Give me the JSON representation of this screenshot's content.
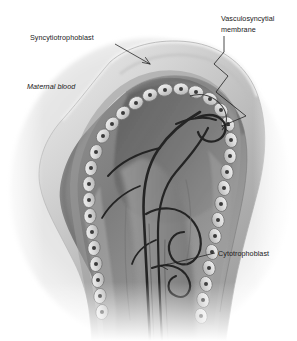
{
  "figure": {
    "type": "anatomical-illustration",
    "background_color": "#ffffff",
    "palette": {
      "outer_tissue_light": "#e8e8e8",
      "outer_tissue_mid": "#c9c9c9",
      "syncytium_band": "#b4b4b4",
      "stroma_mid": "#9a9a9a",
      "stroma_dark": "#6f6f6f",
      "stroma_darkest": "#4e4e4e",
      "cell_body": "#dcdcdc",
      "cell_outline": "#6b6b6b",
      "cell_nucleus": "#3a3a3a",
      "vessel_dark": "#242424",
      "leader_line": "#1d1d1d",
      "label_color": "#1a1a1a"
    }
  },
  "labels": [
    {
      "id": "syncytiotrophoblast",
      "text": "Syncytiotrophoblast",
      "style": "regular",
      "x": 30,
      "y": 40,
      "anchor": "start"
    },
    {
      "id": "maternal-blood",
      "text": "Maternal blood",
      "style": "italic",
      "x": 27,
      "y": 89,
      "anchor": "start"
    },
    {
      "id": "vasculosyncytial-membrane-line1",
      "text": "Vasculosyncytial",
      "style": "regular",
      "x": 221,
      "y": 21,
      "anchor": "start"
    },
    {
      "id": "vasculosyncytial-membrane-line2",
      "text": "membrane",
      "style": "regular",
      "x": 221,
      "y": 32,
      "anchor": "start"
    },
    {
      "id": "cytotrophoblast",
      "text": "Cytotrophoblast",
      "style": "regular",
      "x": 218,
      "y": 256,
      "anchor": "start"
    }
  ],
  "structures": [
    {
      "id": "syncytiotrophoblast-layer",
      "name": "Syncytiotrophoblast"
    },
    {
      "id": "cytotrophoblast-cell-chain",
      "name": "Cytotrophoblast cell layer"
    },
    {
      "id": "vasculosyncytial-membrane",
      "name": "Vasculosyncytial membrane"
    },
    {
      "id": "fetal-capillary-network",
      "name": "Fetal capillaries"
    },
    {
      "id": "intervillous-space",
      "name": "Maternal blood space"
    }
  ]
}
